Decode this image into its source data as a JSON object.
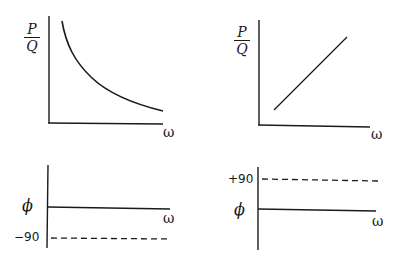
{
  "panels": {
    "top_left": {
      "y_label_num": "P",
      "y_label_den": "Q",
      "x_label": "ω",
      "curve": "decreasing hyperbola"
    },
    "top_right": {
      "y_label_num": "P",
      "y_label_den": "Q",
      "x_label": "ω",
      "curve": "increasing straight line"
    },
    "bottom_left": {
      "y_label": "ϕ",
      "x_label": "ω",
      "dashed_level_label": "−90"
    },
    "bottom_right": {
      "y_label": "ϕ",
      "x_label": "ω",
      "dashed_level_label": "+90"
    }
  },
  "colors": {
    "ink": "#1a1a1a",
    "background": "#ffffff"
  }
}
